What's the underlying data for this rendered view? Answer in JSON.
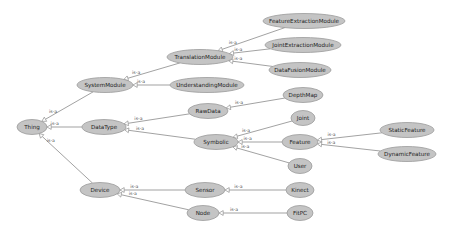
{
  "diagram": {
    "type": "ontology-class-hierarchy",
    "edge_label": "is-a",
    "colors": {
      "node_fill": "#c4c4c4",
      "node_stroke": "#9a9a9a",
      "edge": "#7a7a7a",
      "background": "#ffffff"
    },
    "nodes": [
      {
        "id": "Thing",
        "label": "Thing",
        "x": 32,
        "y": 127,
        "rx": 15,
        "ry": 7.5
      },
      {
        "id": "SystemModule",
        "label": "SystemModule",
        "x": 105,
        "y": 85,
        "rx": 28,
        "ry": 7.5
      },
      {
        "id": "DataType",
        "label": "DataType",
        "x": 104,
        "y": 127,
        "rx": 22,
        "ry": 7.5
      },
      {
        "id": "Device",
        "label": "Device",
        "x": 100,
        "y": 190,
        "rx": 20,
        "ry": 7.5
      },
      {
        "id": "TranslationModule",
        "label": "TranslationModule",
        "x": 200,
        "y": 57,
        "rx": 33,
        "ry": 7.5
      },
      {
        "id": "UnderstandingModule",
        "label": "UnderstandingModule",
        "x": 207,
        "y": 85,
        "rx": 37,
        "ry": 7.5
      },
      {
        "id": "RawData",
        "label": "RawData",
        "x": 208,
        "y": 111,
        "rx": 20,
        "ry": 7.5
      },
      {
        "id": "Symbolic",
        "label": "Symbolic",
        "x": 216,
        "y": 142,
        "rx": 22,
        "ry": 7.5
      },
      {
        "id": "Sensor",
        "label": "Sensor",
        "x": 205,
        "y": 190,
        "rx": 20,
        "ry": 7.5
      },
      {
        "id": "Node",
        "label": "Node",
        "x": 203,
        "y": 213,
        "rx": 16,
        "ry": 7.5
      },
      {
        "id": "FeatureExtractionModule",
        "label": "FeatureExtractionModule",
        "x": 304,
        "y": 21,
        "rx": 41,
        "ry": 7.5
      },
      {
        "id": "JointExtractionModule",
        "label": "JointExtractionModule",
        "x": 303,
        "y": 45,
        "rx": 38,
        "ry": 7.5
      },
      {
        "id": "DataFusionModule",
        "label": "DataFusionModule",
        "x": 300,
        "y": 70,
        "rx": 31,
        "ry": 7.5
      },
      {
        "id": "DepthMap",
        "label": "DepthMap",
        "x": 303,
        "y": 95,
        "rx": 20,
        "ry": 7.5
      },
      {
        "id": "Joint",
        "label": "Joint",
        "x": 303,
        "y": 118,
        "rx": 12,
        "ry": 7.5
      },
      {
        "id": "Feature",
        "label": "Feature",
        "x": 300,
        "y": 142,
        "rx": 18,
        "ry": 7.5
      },
      {
        "id": "User",
        "label": "User",
        "x": 300,
        "y": 166,
        "rx": 12,
        "ry": 7.5
      },
      {
        "id": "Kinect",
        "label": "Kinect",
        "x": 300,
        "y": 190,
        "rx": 14,
        "ry": 7.5
      },
      {
        "id": "FitPC",
        "label": "FitPC",
        "x": 300,
        "y": 213,
        "rx": 13,
        "ry": 7.5
      },
      {
        "id": "StaticFeature",
        "label": "StaticFeature",
        "x": 407,
        "y": 130,
        "rx": 27,
        "ry": 7.5
      },
      {
        "id": "DynamicFeature",
        "label": "DynamicFeature",
        "x": 407,
        "y": 154,
        "rx": 29,
        "ry": 7.5
      }
    ],
    "edges": [
      {
        "from": "SystemModule",
        "to": "Thing",
        "label": "is-a"
      },
      {
        "from": "DataType",
        "to": "Thing",
        "label": "is-a"
      },
      {
        "from": "Device",
        "to": "Thing",
        "label": "is-a"
      },
      {
        "from": "TranslationModule",
        "to": "SystemModule",
        "label": "is-a"
      },
      {
        "from": "UnderstandingModule",
        "to": "SystemModule",
        "label": "is-a"
      },
      {
        "from": "RawData",
        "to": "DataType",
        "label": "is-a"
      },
      {
        "from": "Symbolic",
        "to": "DataType",
        "label": "is-a"
      },
      {
        "from": "Sensor",
        "to": "Device",
        "label": "is-a"
      },
      {
        "from": "Node",
        "to": "Device",
        "label": "is-a"
      },
      {
        "from": "FeatureExtractionModule",
        "to": "TranslationModule",
        "label": "is-a"
      },
      {
        "from": "JointExtractionModule",
        "to": "TranslationModule",
        "label": "is-a"
      },
      {
        "from": "DataFusionModule",
        "to": "TranslationModule",
        "label": "is-a"
      },
      {
        "from": "DepthMap",
        "to": "RawData",
        "label": "is-a"
      },
      {
        "from": "Joint",
        "to": "Symbolic",
        "label": "is-a"
      },
      {
        "from": "Feature",
        "to": "Symbolic",
        "label": "is-a"
      },
      {
        "from": "User",
        "to": "Symbolic",
        "label": "is-a"
      },
      {
        "from": "Kinect",
        "to": "Sensor",
        "label": "is-a"
      },
      {
        "from": "FitPC",
        "to": "Node",
        "label": "is-a"
      },
      {
        "from": "StaticFeature",
        "to": "Feature",
        "label": "is-a"
      },
      {
        "from": "DynamicFeature",
        "to": "Feature",
        "label": "is-a"
      }
    ]
  }
}
